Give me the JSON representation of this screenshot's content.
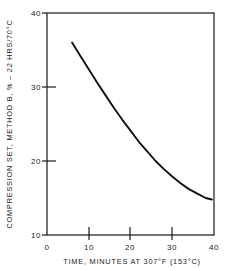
{
  "chart_data": {
    "type": "line",
    "title": "",
    "xlabel": "TIME, MINUTES AT 307°F (153°C)",
    "ylabel": "COMPRESSION SET, METHOD B, % – 22 HRS/70°C",
    "xlim": [
      0,
      40
    ],
    "ylim": [
      10,
      40
    ],
    "xticks": [
      0,
      10,
      20,
      30,
      40
    ],
    "yticks": [
      10,
      20,
      30,
      40
    ],
    "xtick_labels": [
      "0",
      "10",
      "20",
      "30",
      "40"
    ],
    "ytick_labels": [
      "10",
      "20",
      "30",
      "40"
    ],
    "grid": false,
    "legend": null,
    "series": [
      {
        "name": "Compression set vs cure time",
        "color": "#111111",
        "line_width": 1.9,
        "x": [
          6.0,
          8.0,
          10.0,
          12.0,
          14.0,
          16.0,
          18.0,
          20.0,
          22.0,
          24.0,
          26.0,
          28.0,
          30.0,
          32.0,
          34.0,
          36.0,
          38.0,
          39.5
        ],
        "y": [
          36.0,
          34.2,
          32.4,
          30.6,
          28.9,
          27.2,
          25.6,
          24.1,
          22.6,
          21.3,
          20.0,
          18.9,
          17.9,
          17.0,
          16.2,
          15.6,
          15.0,
          14.8
        ]
      }
    ]
  },
  "axes": {
    "xtick_label_0": "0",
    "xtick_label_1": "10",
    "xtick_label_2": "20",
    "xtick_label_3": "30",
    "xtick_label_4": "40",
    "ytick_label_0": "10",
    "ytick_label_1": "20",
    "ytick_label_2": "30",
    "ytick_label_3": "40",
    "x_axis_title": "TIME, MINUTES AT 307°F (153°C)",
    "y_axis_title": "COMPRESSION SET, METHOD B, % – 22 HRS/70°C"
  },
  "style": {
    "background": "#ffffff",
    "frame_color": "#1a1a1a",
    "curve_color": "#111111"
  }
}
